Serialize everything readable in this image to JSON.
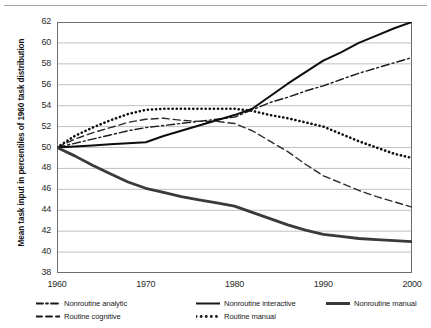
{
  "chart_data": {
    "type": "line",
    "title": "",
    "xlabel": "",
    "ylabel": "Mean task input in percentiles of 1960 task distribution",
    "x": [
      1960,
      1970,
      1980,
      1990,
      2000
    ],
    "xticks": [
      "1960",
      "1970",
      "1980",
      "1990",
      "2000"
    ],
    "yticks": [
      "38",
      "40",
      "42",
      "44",
      "46",
      "48",
      "50",
      "52",
      "54",
      "56",
      "58",
      "60",
      "62"
    ],
    "xlim": [
      1960,
      2000
    ],
    "ylim": [
      38,
      62
    ],
    "grid": "horizontal",
    "legend_position": "below",
    "series": [
      {
        "name": "Nonroutine analytic",
        "style": "dash-dot",
        "color": "#1a1a1a",
        "width": 1.4,
        "values": [
          50.0,
          51.9,
          52.9,
          55.9,
          58.6
        ],
        "points": [
          [
            1960,
            50.0
          ],
          [
            1962,
            50.4
          ],
          [
            1964,
            50.8
          ],
          [
            1966,
            51.2
          ],
          [
            1968,
            51.6
          ],
          [
            1970,
            51.9
          ],
          [
            1972,
            52.1
          ],
          [
            1974,
            52.3
          ],
          [
            1976,
            52.5
          ],
          [
            1978,
            52.7
          ],
          [
            1980,
            52.9
          ],
          [
            1982,
            53.6
          ],
          [
            1984,
            54.3
          ],
          [
            1986,
            54.8
          ],
          [
            1988,
            55.4
          ],
          [
            1990,
            55.9
          ],
          [
            1992,
            56.5
          ],
          [
            1994,
            57.1
          ],
          [
            1996,
            57.6
          ],
          [
            1998,
            58.1
          ],
          [
            2000,
            58.6
          ]
        ]
      },
      {
        "name": "Routine cognitive",
        "style": "dashed",
        "color": "#2b2b2b",
        "width": 1.4,
        "values": [
          50.0,
          52.7,
          52.3,
          47.3,
          44.3
        ],
        "points": [
          [
            1960,
            50.0
          ],
          [
            1962,
            50.8
          ],
          [
            1964,
            51.4
          ],
          [
            1966,
            51.9
          ],
          [
            1968,
            52.4
          ],
          [
            1970,
            52.7
          ],
          [
            1972,
            52.8
          ],
          [
            1974,
            52.6
          ],
          [
            1976,
            52.5
          ],
          [
            1978,
            52.5
          ],
          [
            1980,
            52.3
          ],
          [
            1982,
            51.6
          ],
          [
            1984,
            50.6
          ],
          [
            1986,
            49.6
          ],
          [
            1988,
            48.4
          ],
          [
            1990,
            47.3
          ],
          [
            1992,
            46.6
          ],
          [
            1994,
            45.9
          ],
          [
            1996,
            45.3
          ],
          [
            1998,
            44.8
          ],
          [
            2000,
            44.3
          ]
        ]
      },
      {
        "name": "Nonroutine interactive",
        "style": "solid",
        "color": "#0d0d0d",
        "width": 2.0,
        "values": [
          50.0,
          50.5,
          53.1,
          58.3,
          62.0
        ],
        "points": [
          [
            1960,
            50.0
          ],
          [
            1962,
            50.1
          ],
          [
            1964,
            50.2
          ],
          [
            1966,
            50.3
          ],
          [
            1968,
            50.4
          ],
          [
            1970,
            50.5
          ],
          [
            1972,
            51.1
          ],
          [
            1974,
            51.6
          ],
          [
            1976,
            52.1
          ],
          [
            1978,
            52.6
          ],
          [
            1980,
            53.1
          ],
          [
            1982,
            53.7
          ],
          [
            1984,
            54.9
          ],
          [
            1986,
            56.1
          ],
          [
            1988,
            57.2
          ],
          [
            1990,
            58.3
          ],
          [
            1992,
            59.1
          ],
          [
            1994,
            60.0
          ],
          [
            1996,
            60.7
          ],
          [
            1998,
            61.4
          ],
          [
            2000,
            62.0
          ]
        ]
      },
      {
        "name": "Routine manual",
        "style": "dotted",
        "color": "#0d0d0d",
        "width": 2.6,
        "values": [
          50.0,
          53.6,
          53.7,
          52.0,
          49.0
        ],
        "points": [
          [
            1960,
            50.0
          ],
          [
            1962,
            51.1
          ],
          [
            1964,
            51.9
          ],
          [
            1966,
            52.6
          ],
          [
            1968,
            53.2
          ],
          [
            1970,
            53.6
          ],
          [
            1972,
            53.7
          ],
          [
            1974,
            53.7
          ],
          [
            1976,
            53.7
          ],
          [
            1978,
            53.7
          ],
          [
            1980,
            53.7
          ],
          [
            1982,
            53.5
          ],
          [
            1984,
            53.1
          ],
          [
            1986,
            52.8
          ],
          [
            1988,
            52.4
          ],
          [
            1990,
            52.0
          ],
          [
            1992,
            51.3
          ],
          [
            1994,
            50.6
          ],
          [
            1996,
            50.0
          ],
          [
            1998,
            49.4
          ],
          [
            2000,
            49.0
          ]
        ]
      },
      {
        "name": "Nonroutine manual",
        "style": "solid",
        "color": "#3a3a3a",
        "width": 2.8,
        "values": [
          50.0,
          46.1,
          44.4,
          41.7,
          41.0
        ],
        "points": [
          [
            1960,
            50.0
          ],
          [
            1962,
            49.2
          ],
          [
            1964,
            48.3
          ],
          [
            1966,
            47.5
          ],
          [
            1968,
            46.7
          ],
          [
            1970,
            46.1
          ],
          [
            1972,
            45.7
          ],
          [
            1974,
            45.3
          ],
          [
            1976,
            45.0
          ],
          [
            1978,
            44.7
          ],
          [
            1980,
            44.4
          ],
          [
            1982,
            43.8
          ],
          [
            1984,
            43.2
          ],
          [
            1986,
            42.6
          ],
          [
            1988,
            42.1
          ],
          [
            1990,
            41.7
          ],
          [
            1992,
            41.5
          ],
          [
            1994,
            41.3
          ],
          [
            1996,
            41.2
          ],
          [
            1998,
            41.1
          ],
          [
            2000,
            41.0
          ]
        ]
      }
    ]
  },
  "legend": {
    "items": [
      {
        "label": "Nonroutine analytic",
        "style": "dash-dot",
        "row": 0,
        "col": 0
      },
      {
        "label": "Nonroutine interactive",
        "style": "solid",
        "row": 0,
        "col": 1
      },
      {
        "label": "Nonroutine manual",
        "style": "thick",
        "row": 0,
        "col": 2
      },
      {
        "label": "Routine cognitive",
        "style": "dashed",
        "row": 1,
        "col": 0
      },
      {
        "label": "Routine manual",
        "style": "dotted",
        "row": 1,
        "col": 1
      }
    ]
  },
  "axes": {
    "y_title": "Mean task input in percentiles of 1960 task distribution"
  },
  "colors": {
    "grid": "#b0b0b0",
    "axis": "#6e6e6e",
    "text": "#1a1a1a"
  }
}
